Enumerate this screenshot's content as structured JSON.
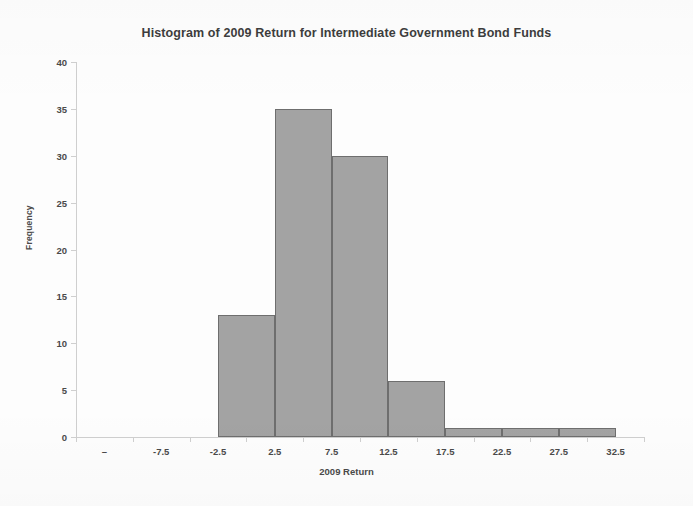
{
  "chart_data": {
    "type": "bar",
    "title": "Histogram of 2009 Return for Intermediate Government Bond Funds",
    "xlabel": "2009 Return",
    "ylabel": "Frequency",
    "categories": [
      "–",
      "-7.5",
      "-2.5",
      "2.5",
      "7.5",
      "12.5",
      "17.5",
      "22.5",
      "27.5",
      "32.5"
    ],
    "values": [
      0,
      0,
      13,
      35,
      30,
      6,
      1,
      1,
      1,
      0
    ],
    "bars": [
      {
        "label": "-2.5",
        "value": 13
      },
      {
        "label": "2.5",
        "value": 35
      },
      {
        "label": "7.5",
        "value": 30
      },
      {
        "label": "12.5",
        "value": 6
      },
      {
        "label": "17.5",
        "value": 1
      },
      {
        "label": "22.5",
        "value": 1
      },
      {
        "label": "27.5",
        "value": 1
      }
    ],
    "ylim": [
      0,
      40
    ],
    "yticks": [
      "0",
      "5",
      "10",
      "15",
      "20",
      "25",
      "30",
      "35",
      "40"
    ],
    "grid": false,
    "legend": "none",
    "bar_color": "#a3a3a3",
    "bar_border_color": "#6e6e6e",
    "axis_color": "#cfcfcf",
    "text_color": "#4a4a4a",
    "background": "#fdfdfd"
  }
}
